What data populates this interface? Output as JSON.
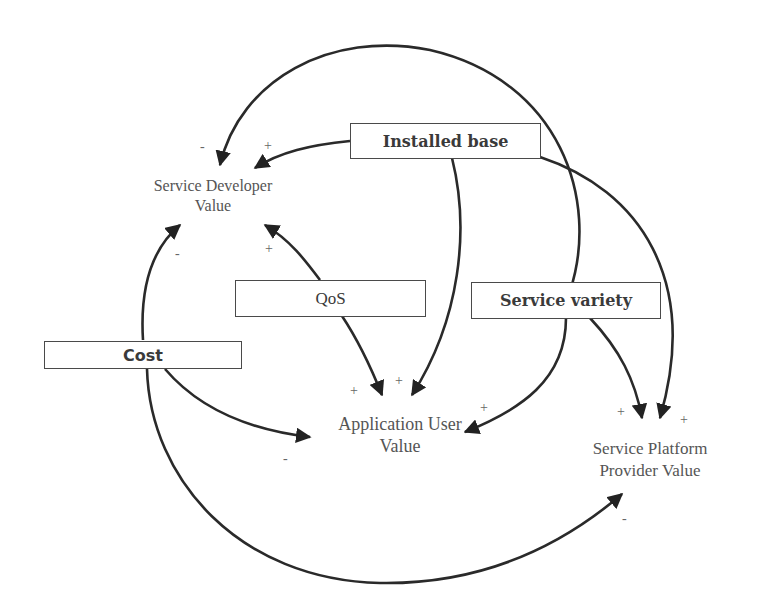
{
  "diagram": {
    "type": "causal-loop-diagram",
    "boxes": {
      "installed_base": "Installed base",
      "qos": "QoS",
      "service_variety": "Service variety",
      "cost": "Cost"
    },
    "nodes": {
      "service_developer_value": [
        "Service Developer",
        "Value"
      ],
      "application_user_value": [
        "Application User",
        "Value"
      ],
      "service_platform_provider_value": [
        "Service Platform",
        "Provider Value"
      ]
    },
    "signs": {
      "sdv_from_loop": "-",
      "sdv_from_installed_base": "+",
      "sdv_from_cost": "-",
      "sdv_from_qos": "+",
      "auv_from_qos": "+",
      "auv_from_installed_base": "+",
      "auv_from_loop": "+",
      "auv_from_cost": "-",
      "sppv_from_service_variety": "+",
      "sppv_from_installed_base": "+",
      "sppv_from_cost": "-"
    },
    "edges": [
      {
        "from": "Installed base",
        "to": "Service Developer Value",
        "polarity": "+"
      },
      {
        "from": "Installed base",
        "to": "Application User Value",
        "polarity": "+"
      },
      {
        "from": "Installed base",
        "to": "Service Platform Provider Value",
        "polarity": "+"
      },
      {
        "from": "QoS",
        "to": "Service Developer Value",
        "polarity": "+"
      },
      {
        "from": "QoS",
        "to": "Application User Value",
        "polarity": "+"
      },
      {
        "from": "Service variety",
        "to": "Service Developer Value",
        "polarity": "-"
      },
      {
        "from": "Service variety",
        "to": "Application User Value",
        "polarity": "+"
      },
      {
        "from": "Service variety",
        "to": "Service Platform Provider Value",
        "polarity": "+"
      },
      {
        "from": "Cost",
        "to": "Service Developer Value",
        "polarity": "-"
      },
      {
        "from": "Cost",
        "to": "Application User Value",
        "polarity": "-"
      },
      {
        "from": "Cost",
        "to": "Service Platform Provider Value",
        "polarity": "-"
      }
    ]
  }
}
